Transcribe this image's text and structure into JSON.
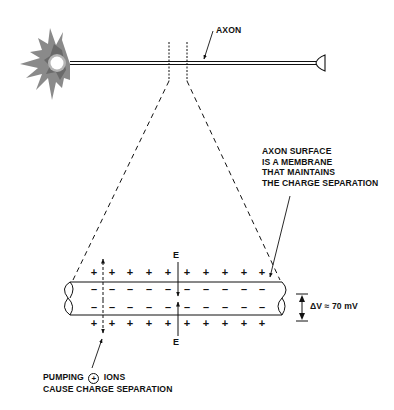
{
  "labels": {
    "axon": "AXON",
    "membrane_line1": "AXON SURFACE",
    "membrane_line2": "IS A MEMBRANE",
    "membrane_line3": "THAT MAINTAINS",
    "membrane_line4": "THE CHARGE SEPARATION",
    "pumping_pre": "PUMPING",
    "pumping_symbol": "+",
    "pumping_post": "IONS",
    "pumping_line2": "CAUSE CHARGE SEPARATION",
    "e_field_top": "E",
    "e_field_bottom": "E",
    "voltage": "ΔV ≈ 70 mV"
  },
  "charges": {
    "outer_top": [
      "+",
      "+",
      "+",
      "+",
      "+",
      "+",
      "+",
      "+",
      "+",
      "+",
      "+"
    ],
    "inner_top": [
      "–",
      "–",
      "–",
      "–",
      "–",
      "–",
      "–",
      "–",
      "–",
      "–",
      "–"
    ],
    "inner_bottom": [
      "–",
      "–",
      "–",
      "–",
      "–",
      "–",
      "–",
      "–",
      "–",
      "–",
      "–"
    ],
    "outer_bottom": [
      "+",
      "+",
      "+",
      "+",
      "+",
      "+",
      "+",
      "+",
      "+",
      "+",
      "+"
    ]
  },
  "colors": {
    "line": "#111111",
    "soma_dark": "#6e6e6e",
    "soma_light": "#a8a8a8",
    "nucleus": "#ffffff"
  }
}
